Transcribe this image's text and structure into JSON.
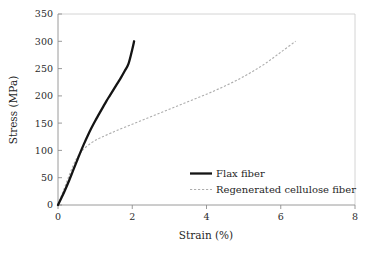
{
  "chart_data": {
    "type": "line",
    "title": "",
    "subtitle": "",
    "xlabel": "Strain (%)",
    "ylabel": "Stress (MPa)",
    "xlim": [
      0,
      8
    ],
    "ylim": [
      0,
      350
    ],
    "xticks": [
      "0",
      "2",
      "4",
      "6",
      "8"
    ],
    "xtick_values": [
      0,
      2,
      4,
      6,
      8
    ],
    "yticks": [
      "0",
      "50",
      "100",
      "150",
      "200",
      "250",
      "300",
      "350"
    ],
    "ytick_values": [
      0,
      50,
      100,
      150,
      200,
      250,
      300,
      350
    ],
    "grid": false,
    "legend_position": "center-right",
    "series": [
      {
        "name": "Flax fiber",
        "style": "solid",
        "color": "#141414",
        "x": [
          0,
          0.1,
          0.2,
          0.3,
          0.4,
          0.5,
          0.6,
          0.7,
          0.8,
          0.9,
          1.0,
          1.1,
          1.2,
          1.3,
          1.4,
          1.5,
          1.6,
          1.7,
          1.8,
          1.9,
          2.0,
          2.05
        ],
        "y": [
          0,
          14,
          29,
          45,
          62,
          79,
          96,
          112,
          127,
          141,
          154,
          166,
          178,
          190,
          201,
          212,
          223,
          234,
          246,
          259,
          285,
          300
        ]
      },
      {
        "name": "Regenerated cellulose fiber",
        "style": "dashed",
        "color": "#adadad",
        "x": [
          0,
          0.1,
          0.2,
          0.3,
          0.4,
          0.5,
          0.6,
          0.7,
          0.9,
          1.1,
          1.3,
          1.6,
          2.0,
          2.4,
          2.8,
          3.2,
          3.6,
          4.0,
          4.4,
          4.8,
          5.2,
          5.6,
          6.0,
          6.4
        ],
        "y": [
          0,
          18,
          36,
          54,
          71,
          85,
          95,
          103,
          114,
          122,
          128,
          137,
          148,
          159,
          170,
          181,
          192,
          203,
          215,
          228,
          243,
          260,
          280,
          300
        ]
      }
    ]
  },
  "legend": {
    "items": [
      {
        "label": "Flax fiber",
        "style": "solid"
      },
      {
        "label": "Regenerated cellulose fiber",
        "style": "dashed"
      }
    ]
  },
  "axes": {
    "x_title": "Strain (%)",
    "y_title": "Stress (MPa)"
  },
  "colors": {
    "background": "#ffffff",
    "axis": "#8e8e8e",
    "frame": "#c9c9c9",
    "text": "#1f1f1f",
    "flax": "#141414",
    "cellulose": "#adadad"
  }
}
